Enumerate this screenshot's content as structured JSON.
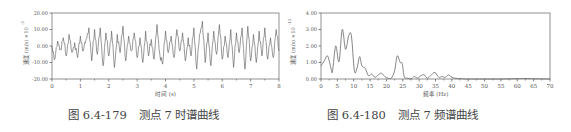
{
  "figures": [
    {
      "caption_number": "图 6.4-179",
      "caption_text": "测点 7 时谱曲线"
    },
    {
      "caption_number": "图 6.4-180",
      "caption_text": "测点 7 频谱曲线"
    }
  ],
  "chart_data": [
    {
      "type": "line",
      "title": "测点 7 时谱曲线",
      "xlabel": "时间 (s)",
      "ylabel": "速度 (m/s) ×10^-3",
      "xlim": [
        0,
        8
      ],
      "ylim": [
        -20,
        20
      ],
      "x_ticks": [
        "0",
        "1",
        "2",
        "3",
        "4",
        "5",
        "6",
        "7",
        "8"
      ],
      "y_ticks": [
        "-20.00",
        "-10.00",
        "0.00",
        "10.00",
        "20.00"
      ],
      "grid": false,
      "legend": "none",
      "series": [
        {
          "name": "velocity",
          "description": "random vibration signal oscillating roughly between -15 and +15 about zero",
          "x": [
            0,
            0.1,
            0.2,
            0.3,
            0.4,
            0.5,
            0.6,
            0.7,
            0.8,
            0.9,
            1.0,
            1.1,
            1.2,
            1.3,
            1.4,
            1.5,
            1.6,
            1.7,
            1.8,
            1.9,
            2.0,
            2.1,
            2.2,
            2.3,
            2.4,
            2.5,
            2.6,
            2.7,
            2.8,
            2.9,
            3.0,
            3.1,
            3.2,
            3.3,
            3.4,
            3.5,
            3.6,
            3.7,
            3.8,
            3.9,
            4.0,
            4.1,
            4.2,
            4.3,
            4.4,
            4.5,
            4.6,
            4.7,
            4.8,
            4.9,
            5.0,
            5.1,
            5.2,
            5.3,
            5.4,
            5.5,
            5.6,
            5.7,
            5.8,
            5.9,
            6.0,
            6.1,
            6.2,
            6.3,
            6.4,
            6.5,
            6.6,
            6.7,
            6.8,
            6.9,
            7.0,
            7.1,
            7.2,
            7.3,
            7.4,
            7.5,
            7.6,
            7.7,
            7.8,
            7.9,
            8.0
          ],
          "y": [
            0,
            -8,
            3,
            -2,
            5,
            -6,
            7,
            -4,
            2,
            -7,
            6,
            -3,
            4,
            11,
            -9,
            10,
            -5,
            11,
            -12,
            8,
            -6,
            9,
            -13,
            7,
            -4,
            12,
            -9,
            6,
            -3,
            8,
            -7,
            5,
            -10,
            9,
            -6,
            4,
            -8,
            13,
            -5,
            -11,
            9,
            -4,
            6,
            -7,
            10,
            -3,
            8,
            -9,
            5,
            -6,
            11,
            -14,
            7,
            15,
            -10,
            8,
            -12,
            9,
            -5,
            13,
            -8,
            6,
            -7,
            10,
            -13,
            8,
            -4,
            11,
            -14,
            12,
            -9,
            7,
            -10,
            9,
            -6,
            11,
            -8,
            5,
            -7,
            10,
            -3
          ]
        }
      ]
    },
    {
      "type": "line",
      "title": "测点 7 频谱曲线",
      "xlabel": "频率 (Hz)",
      "ylabel": "速度 (m/s) ×10^-12",
      "xlim": [
        0,
        70
      ],
      "ylim": [
        0,
        4
      ],
      "x_ticks": [
        "0",
        "5",
        "10",
        "15",
        "20",
        "25",
        "30",
        "35",
        "40",
        "45",
        "50",
        "55",
        "60",
        "65",
        "70"
      ],
      "y_ticks": [
        "0.00",
        "1.00",
        "2.00",
        "3.00",
        "4.00"
      ],
      "grid": false,
      "legend": "none",
      "series": [
        {
          "name": "spectrum",
          "x": [
            0,
            1,
            2,
            3,
            3.5,
            4.5,
            5.5,
            6.5,
            7.5,
            8.5,
            9.3,
            10.2,
            11,
            11.8,
            12.5,
            13.5,
            14.5,
            15.5,
            16.5,
            17.5,
            18.5,
            19.5,
            20.5,
            21.5,
            22.5,
            23.3,
            24.2,
            24.8,
            25.5,
            26.5,
            27.5,
            28.5,
            29.5,
            30.5,
            31.5,
            32.5,
            33.5,
            34.8,
            36,
            37,
            38,
            39,
            40,
            41,
            42,
            43,
            44,
            50,
            55,
            60,
            62,
            64,
            66,
            70
          ],
          "y": [
            0.8,
            1.1,
            1.4,
            0.7,
            0.45,
            2.0,
            1.05,
            3.0,
            1.8,
            2.65,
            2.6,
            0.5,
            0.65,
            1.35,
            0.8,
            0.65,
            0.2,
            0.3,
            0.1,
            0.25,
            0.35,
            0.15,
            0.05,
            0.05,
            0.5,
            1.4,
            1.0,
            0.95,
            0.1,
            0.05,
            0.0,
            0.15,
            0.05,
            0.2,
            0.25,
            0.05,
            0.2,
            0.4,
            0.1,
            0.15,
            0.1,
            0.25,
            0.1,
            0.05,
            0.02,
            0.03,
            0.0,
            0.0,
            0.0,
            0.02,
            0.03,
            0.02,
            0.01,
            0.0
          ]
        }
      ]
    }
  ]
}
